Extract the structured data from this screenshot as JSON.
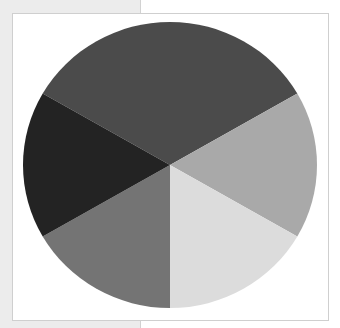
{
  "chart_data": {
    "type": "pie",
    "title": "",
    "legend": [],
    "start_angle_deg": 150,
    "direction": "clockwise",
    "slices": [
      {
        "label": "",
        "value": 33.3,
        "angle_deg": 120,
        "color": "#4b4b4b",
        "position": "top"
      },
      {
        "label": "",
        "value": 16.7,
        "angle_deg": 60,
        "color": "#a9a9a9",
        "position": "right"
      },
      {
        "label": "",
        "value": 16.7,
        "angle_deg": 60,
        "color": "#dcdcdc",
        "position": "bottom-right"
      },
      {
        "label": "",
        "value": 16.7,
        "angle_deg": 60,
        "color": "#747474",
        "position": "bottom-left"
      },
      {
        "label": "",
        "value": 16.7,
        "angle_deg": 60,
        "color": "#232323",
        "position": "left"
      }
    ],
    "center": [
      170,
      165
    ],
    "radius": [
      147,
      143
    ]
  }
}
